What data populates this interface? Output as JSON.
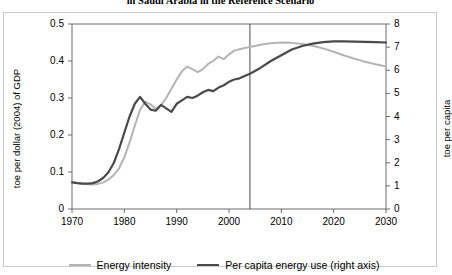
{
  "chart_data": {
    "type": "line",
    "title": "in Saudi Arabia in the Reference Scenario",
    "xlabel": "",
    "ylabel": "toe per dollar (2004) of GDP",
    "y2label": "toe per capita",
    "xlim": [
      1970,
      2030
    ],
    "ylim": [
      0,
      0.5
    ],
    "y2lim": [
      0,
      8
    ],
    "xticks": [
      "1970",
      "1980",
      "1990",
      "2000",
      "2010",
      "2020",
      "2030"
    ],
    "xtick_values": [
      1970,
      1980,
      1990,
      2000,
      2010,
      2020,
      2030
    ],
    "yticks": [
      "0",
      "0.1",
      "0.2",
      "0.3",
      "0.4",
      "0.5"
    ],
    "ytick_values": [
      0,
      0.1,
      0.2,
      0.3,
      0.4,
      0.5
    ],
    "y2ticks": [
      "0",
      "1",
      "2",
      "3",
      "4",
      "5",
      "6",
      "7",
      "8"
    ],
    "y2tick_values": [
      0,
      1,
      2,
      3,
      4,
      5,
      6,
      7,
      8
    ],
    "grid": false,
    "legend_position": "bottom",
    "projection_divider_year": 2004,
    "series": [
      {
        "name": "Energy intensity",
        "axis": "left",
        "color": "#b4b4b4",
        "width": 2,
        "x": [
          1970,
          1971,
          1972,
          1973,
          1974,
          1975,
          1976,
          1977,
          1978,
          1979,
          1980,
          1981,
          1982,
          1983,
          1984,
          1985,
          1986,
          1987,
          1988,
          1989,
          1990,
          1991,
          1992,
          1993,
          1994,
          1995,
          1996,
          1997,
          1998,
          1999,
          2000,
          2001,
          2002,
          2003,
          2004,
          2006,
          2008,
          2010,
          2012,
          2014,
          2016,
          2018,
          2020,
          2022,
          2024,
          2026,
          2028,
          2030
        ],
        "y": [
          0.073,
          0.07,
          0.068,
          0.067,
          0.066,
          0.068,
          0.072,
          0.08,
          0.092,
          0.11,
          0.14,
          0.18,
          0.225,
          0.268,
          0.29,
          0.283,
          0.27,
          0.28,
          0.3,
          0.325,
          0.35,
          0.372,
          0.385,
          0.378,
          0.37,
          0.378,
          0.392,
          0.4,
          0.412,
          0.405,
          0.418,
          0.428,
          0.432,
          0.435,
          0.438,
          0.444,
          0.448,
          0.45,
          0.449,
          0.446,
          0.441,
          0.434,
          0.425,
          0.415,
          0.406,
          0.398,
          0.391,
          0.385
        ]
      },
      {
        "name": "Per capita energy use (right axis)",
        "axis": "right",
        "color": "#4a4a4a",
        "width": 2.2,
        "x": [
          1970,
          1971,
          1972,
          1973,
          1974,
          1975,
          1976,
          1977,
          1978,
          1979,
          1980,
          1981,
          1982,
          1983,
          1984,
          1985,
          1986,
          1987,
          1988,
          1989,
          1990,
          1991,
          1992,
          1993,
          1994,
          1995,
          1996,
          1997,
          1998,
          1999,
          2000,
          2001,
          2002,
          2003,
          2004,
          2006,
          2008,
          2010,
          2012,
          2014,
          2016,
          2018,
          2020,
          2022,
          2024,
          2026,
          2028,
          2030
        ],
        "y": [
          1.15,
          1.12,
          1.1,
          1.1,
          1.12,
          1.2,
          1.35,
          1.6,
          2.0,
          2.6,
          3.3,
          4.0,
          4.55,
          4.85,
          4.55,
          4.3,
          4.25,
          4.5,
          4.35,
          4.2,
          4.55,
          4.7,
          4.85,
          4.8,
          4.9,
          5.05,
          5.15,
          5.1,
          5.25,
          5.35,
          5.5,
          5.6,
          5.65,
          5.75,
          5.85,
          6.1,
          6.4,
          6.65,
          6.9,
          7.05,
          7.15,
          7.22,
          7.25,
          7.25,
          7.24,
          7.23,
          7.22,
          7.2
        ]
      }
    ]
  },
  "legend": {
    "items": [
      {
        "label": "Energy intensity",
        "color": "#b4b4b4"
      },
      {
        "label": "Per capita energy use (right axis)",
        "color": "#4a4a4a"
      }
    ]
  }
}
